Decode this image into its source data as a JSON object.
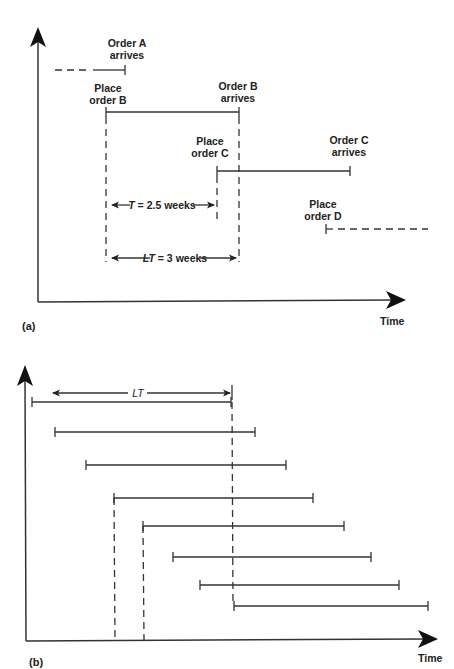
{
  "panel_a": {
    "label": "(a)",
    "x_axis_label": "Time",
    "order_a_line1": "Order A",
    "order_a_line2": "arrives",
    "place_b_line1": "Place",
    "place_b_line2": "order B",
    "order_b_line1": "Order B",
    "order_b_line2": "arrives",
    "place_c_line1": "Place",
    "place_c_line2": "order C",
    "order_c_line1": "Order C",
    "order_c_line2": "arrives",
    "place_d_line1": "Place",
    "place_d_line2": "order D",
    "t_var": "T",
    "t_value": " = 2.5 weeks",
    "lt_var": "LT",
    "lt_value": " = 3 weeks"
  },
  "panel_b": {
    "label": "(b)",
    "x_axis_label": "Time",
    "lt_label": "LT",
    "order_count": 8
  }
}
